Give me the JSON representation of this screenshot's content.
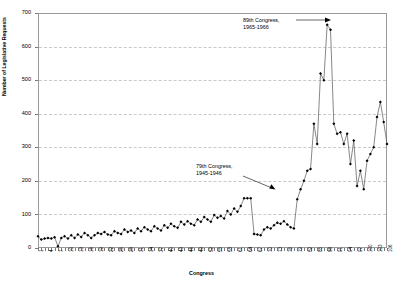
{
  "chart_data": {
    "type": "line",
    "title": "",
    "xlabel": "Congress",
    "ylabel": "Number of Legislative Requests",
    "ylim": [
      0,
      700
    ],
    "ytick_step": 100,
    "yticks": [
      0,
      100,
      200,
      300,
      400,
      500,
      600,
      700
    ],
    "xlim": [
      1,
      106
    ],
    "xtick_step": 3,
    "grid": "horizontal-dashed",
    "legend": "none",
    "marker": "filled-diamond",
    "line_color": "#555555",
    "marker_color": "#000000",
    "grid_color": "#c9c9c9",
    "frame_color": "#9a9a9a",
    "xticks": [
      1,
      4,
      7,
      10,
      13,
      16,
      19,
      22,
      25,
      28,
      31,
      34,
      37,
      40,
      43,
      46,
      49,
      52,
      55,
      58,
      61,
      64,
      67,
      70,
      73,
      76,
      79,
      82,
      85,
      88,
      91,
      94,
      97,
      100,
      103,
      106
    ],
    "x": [
      1,
      2,
      3,
      4,
      5,
      6,
      7,
      8,
      9,
      10,
      11,
      12,
      13,
      14,
      15,
      16,
      17,
      18,
      19,
      20,
      21,
      22,
      23,
      24,
      25,
      26,
      27,
      28,
      29,
      30,
      31,
      32,
      33,
      34,
      35,
      36,
      37,
      38,
      39,
      40,
      41,
      42,
      43,
      44,
      45,
      46,
      47,
      48,
      49,
      50,
      51,
      52,
      53,
      54,
      55,
      56,
      57,
      58,
      59,
      60,
      61,
      62,
      63,
      64,
      65,
      66,
      67,
      68,
      69,
      70,
      71,
      72,
      73,
      74,
      75,
      76,
      77,
      78,
      79,
      80,
      81,
      82,
      83,
      84,
      85,
      86,
      87,
      88,
      89,
      90,
      91,
      92,
      93,
      94,
      95,
      96,
      97,
      98,
      99,
      100,
      101,
      102,
      103,
      104,
      105,
      106
    ],
    "values": [
      35,
      25,
      28,
      30,
      28,
      32,
      5,
      30,
      35,
      28,
      38,
      30,
      40,
      33,
      45,
      38,
      30,
      38,
      45,
      42,
      48,
      40,
      38,
      50,
      45,
      42,
      55,
      48,
      52,
      45,
      58,
      50,
      62,
      55,
      50,
      65,
      58,
      52,
      68,
      60,
      72,
      65,
      60,
      78,
      70,
      80,
      72,
      68,
      85,
      78,
      92,
      85,
      78,
      98,
      90,
      95,
      88,
      110,
      100,
      118,
      108,
      125,
      148,
      148,
      148,
      42,
      40,
      38,
      55,
      62,
      58,
      68,
      75,
      72,
      80,
      70,
      62,
      58,
      145,
      175,
      200,
      230,
      235,
      370,
      310,
      520,
      500,
      665,
      650,
      370,
      340,
      345,
      310,
      340,
      250,
      320,
      185,
      230,
      175,
      260,
      280,
      300,
      390,
      435,
      375,
      310
    ],
    "annotations": [
      {
        "id": "annot-89",
        "line1": "89th Congress,",
        "line2": "1965-1966"
      },
      {
        "id": "annot-79",
        "line1": "79th Congress,",
        "line2": "1945-1946"
      }
    ]
  }
}
